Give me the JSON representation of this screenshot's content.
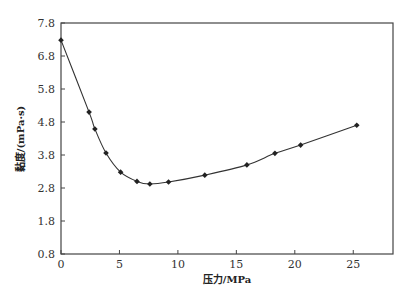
{
  "chart_data": {
    "type": "line",
    "title": "",
    "xlabel": "压力/MPa",
    "ylabel": "黏度/(mPa·s)",
    "xlim": [
      0,
      28.4
    ],
    "ylim": [
      0.8,
      7.8
    ],
    "xticks": [
      0,
      5,
      10,
      15,
      20,
      25
    ],
    "xtick_labels": [
      "0",
      "5",
      "10",
      "15",
      "20",
      "25"
    ],
    "yticks": [
      0.8,
      1.8,
      2.8,
      3.8,
      4.8,
      5.8,
      6.8,
      7.8
    ],
    "ytick_labels": [
      "0.8",
      "1.8",
      "2.8",
      "3.8",
      "4.8",
      "5.8",
      "6.8",
      "7.8"
    ],
    "grid": false,
    "legend": null,
    "series": [
      {
        "name": "黏度",
        "marker": "diamond",
        "color": "#222222",
        "x": [
          0,
          2.4,
          2.9,
          3.85,
          5.1,
          6.5,
          7.6,
          9.2,
          12.3,
          15.9,
          18.3,
          20.5,
          25.3
        ],
        "y": [
          7.28,
          5.1,
          4.59,
          3.86,
          3.28,
          3.0,
          2.92,
          2.98,
          3.19,
          3.5,
          3.85,
          4.1,
          4.7
        ]
      }
    ]
  }
}
